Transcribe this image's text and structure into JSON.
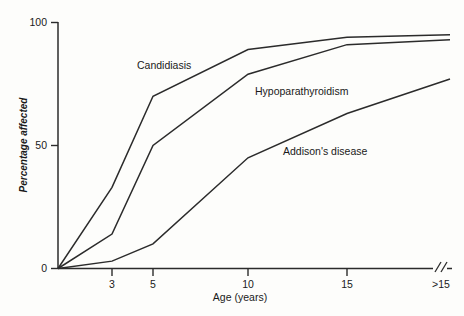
{
  "chart_data": {
    "type": "line",
    "title": "",
    "xlabel": "Age (years)",
    "ylabel": "Percentage affected",
    "x_tick_labels": [
      "3",
      "5",
      "10",
      "15",
      ">15"
    ],
    "x_tick_values": [
      3,
      5,
      10,
      15,
      16
    ],
    "y_tick_labels": [
      "0",
      "50",
      "100"
    ],
    "y_tick_values": [
      0,
      50,
      100
    ],
    "ylim": [
      0,
      100
    ],
    "grid": false,
    "legend_position": "inline-annotations",
    "axis_break": "//",
    "series": [
      {
        "name": "Candidiasis",
        "label": "Candidiasis",
        "x": [
          0,
          3,
          5,
          10,
          15,
          16
        ],
        "values": [
          0,
          33,
          70,
          89,
          94,
          95
        ]
      },
      {
        "name": "Hypoparathyroidism",
        "label": "Hypoparathyroidism",
        "x": [
          0,
          3,
          5,
          10,
          15,
          16
        ],
        "values": [
          0,
          14,
          50,
          79,
          91,
          93
        ]
      },
      {
        "name": "Addison's disease",
        "label": "Addison's disease",
        "x": [
          0,
          3,
          5,
          10,
          15,
          16
        ],
        "values": [
          0,
          3,
          10,
          45,
          63,
          77
        ]
      }
    ]
  },
  "annotations": {
    "candidiasis": "Candidiasis",
    "hypoparathyroidism": "Hypoparathyroidism",
    "addisons": "Addison's disease"
  },
  "ticks": {
    "y0": "0",
    "y50": "50",
    "y100": "100",
    "x3": "3",
    "x5": "5",
    "x10": "10",
    "x15": "15",
    "xgt15": ">15"
  },
  "titles": {
    "x": "Age (years)",
    "y": "Percentage affected"
  },
  "colors": {
    "line": "#2b2b2b",
    "background": "#fdfdfb",
    "text": "#1a1a1a"
  }
}
